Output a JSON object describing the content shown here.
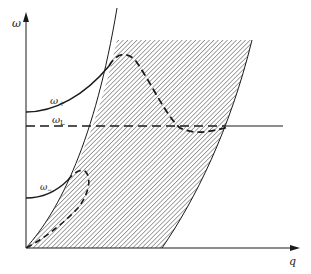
{
  "diagram": {
    "type": "dispersion-relation",
    "axes": {
      "y_label": "ω",
      "x_label": "q"
    },
    "curves": [
      {
        "name": "omega-plus",
        "label_main": "ω",
        "label_sub": "+",
        "style": "solid-then-dashed"
      },
      {
        "name": "omega-L",
        "label_main": "ω",
        "label_sub": "L",
        "style": "dashed-then-solid"
      },
      {
        "name": "omega-minus",
        "label_main": "ω",
        "label_sub": "−",
        "style": "solid-then-dashed"
      }
    ],
    "regions": [
      {
        "name": "hatched-continuum",
        "fill": "diagonal-hatch"
      }
    ],
    "colors": {
      "line": "#1a1a1a",
      "hatch": "#555555",
      "background": "#ffffff"
    }
  }
}
